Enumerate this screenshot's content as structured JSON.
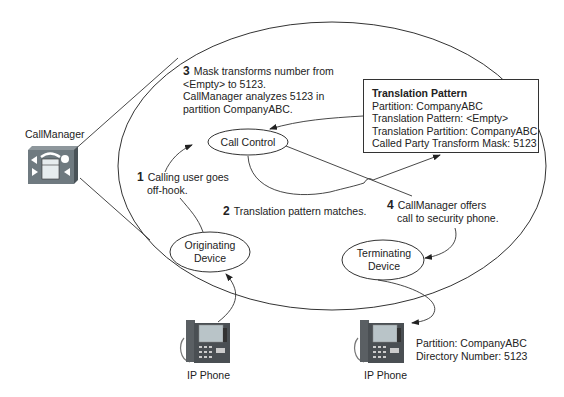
{
  "diagram": {
    "callmanager": {
      "label": "CallManager",
      "icon": "callmanager-server-icon"
    },
    "steps": [
      {
        "number": "1",
        "lines": [
          "Calling user goes",
          "off-hook."
        ]
      },
      {
        "number": "2",
        "lines": [
          "Translation pattern matches."
        ]
      },
      {
        "number": "3",
        "lines": [
          "Mask transforms number from",
          "<Empty> to 5123.",
          "CallManager analyzes 5123 in",
          "partition CompanyABC."
        ]
      },
      {
        "number": "4",
        "lines": [
          "CallManager offers",
          "call to security phone."
        ]
      }
    ],
    "nodes": {
      "call_control": "Call Control",
      "originating_device": [
        "Originating",
        "Device"
      ],
      "terminating_device": [
        "Terminating",
        "Device"
      ]
    },
    "translation_pattern": {
      "title": "Translation Pattern",
      "lines": [
        "Partition: CompanyABC",
        "Translation Pattern: <Empty>",
        "Translation Partition: CompanyABC",
        "Called Party Transform Mask: 5123"
      ]
    },
    "phones": [
      {
        "label": "IP Phone",
        "icon": "ip-phone-icon"
      },
      {
        "label": "IP Phone",
        "icon": "ip-phone-icon",
        "details": [
          "Partition: CompanyABC",
          "Directory Number: 5123"
        ]
      }
    ],
    "colors": {
      "line": "#333333",
      "server_body": "#6f7a80",
      "server_side": "#4a5358",
      "phone_body": "#5a5f63",
      "phone_screen": "#b9c4c8"
    }
  }
}
